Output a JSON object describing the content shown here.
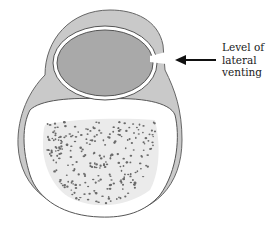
{
  "diagram": {
    "type": "cross-section illustration",
    "annotation": {
      "label_line1": "Level of",
      "label_line2": "lateral",
      "label_line3": "venting",
      "arrow_direction": "left"
    },
    "colors": {
      "outer_layer": "#c9c9c9",
      "inner_oval": "#a9a9a9",
      "outline": "#555555",
      "lower_region": "#ffffff",
      "stippled_region": "#e8e8e8",
      "stipple_dots": "#666666",
      "arrow": "#111111"
    }
  }
}
